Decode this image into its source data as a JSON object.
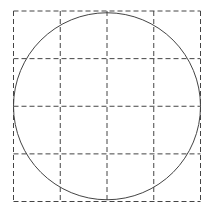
{
  "diagram": {
    "grid": {
      "rows": 4,
      "cols": 4,
      "left": 13.5,
      "top": 11,
      "right": 200.5,
      "bottom": 201.5,
      "line_color": "#444444",
      "dash": "5,3"
    },
    "circle": {
      "cx": 107,
      "cy": 106.25,
      "r": 93.5,
      "stroke": "#444444"
    }
  }
}
